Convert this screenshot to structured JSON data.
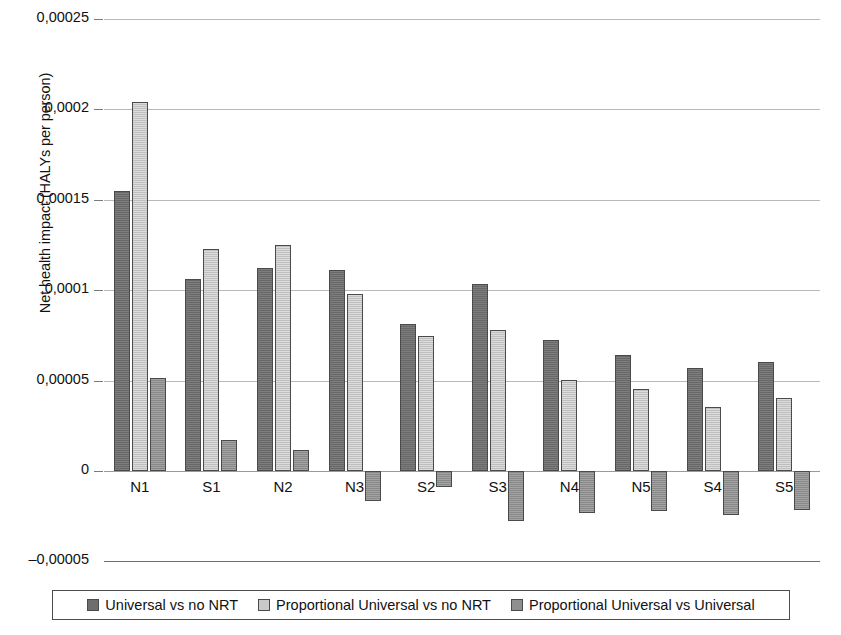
{
  "chart_data": {
    "type": "bar",
    "title": "",
    "xlabel": "",
    "ylabel": "Net health impact (HALYs per person)",
    "categories": [
      "N1",
      "S1",
      "N2",
      "N3",
      "S2",
      "S3",
      "N4",
      "N5",
      "S4",
      "S5"
    ],
    "series": [
      {
        "name": "Universal vs no NRT",
        "color": "#6e6e6e",
        "values": [
          0.000155,
          0.000106,
          0.0001125,
          0.000111,
          8.12e-05,
          0.0001032,
          7.23e-05,
          6.43e-05,
          5.68e-05,
          6.01e-05
        ]
      },
      {
        "name": "Proportional Universal vs no NRT",
        "color": "#c9c9c9",
        "values": [
          0.000204,
          0.0001226,
          0.0001248,
          9.78e-05,
          7.48e-05,
          7.79e-05,
          5.03e-05,
          4.52e-05,
          3.52e-05,
          4.06e-05
        ]
      },
      {
        "name": "Proportional Universal vs Universal",
        "color": "#8f8f8f",
        "values": [
          5.17e-05,
          1.72e-05,
          1.16e-05,
          -1.65e-05,
          -8.8e-06,
          -2.77e-05,
          -2.35e-05,
          -2.22e-05,
          -2.43e-05,
          -2.15e-05
        ]
      }
    ],
    "ylim": [
      -5e-05,
      0.00025
    ],
    "ytick_values": [
      0.00025,
      0.0002,
      0.00015,
      0.0001,
      5e-05,
      0,
      -5e-05
    ],
    "ytick_labels": [
      "0,00025",
      "0,0002",
      "0,00015",
      "0,0001",
      "0,00005",
      "0",
      "–0,00005"
    ],
    "grid": true,
    "legend_position": "bottom"
  },
  "legend": {
    "items": [
      {
        "label": "Universal vs no NRT"
      },
      {
        "label": "Proportional Universal vs no NRT"
      },
      {
        "label": "Proportional Universal vs Universal"
      }
    ]
  }
}
